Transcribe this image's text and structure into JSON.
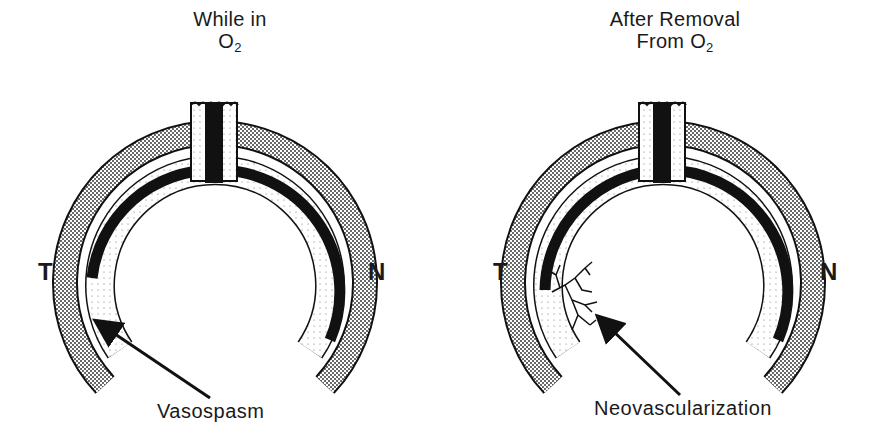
{
  "panels": [
    {
      "id": "left",
      "title_line1": "While in",
      "title_line2_base": "O",
      "title_line2_sub": "2",
      "label_temporal": "T",
      "label_nasal": "N",
      "callout": "Vasospasm"
    },
    {
      "id": "right",
      "title_line1": "After Removal",
      "title_line2_base": "From O",
      "title_line2_sub": "2",
      "label_temporal": "T",
      "label_nasal": "N",
      "callout": "Neovascularization"
    }
  ],
  "colors": {
    "ink": "#111111",
    "background": "#ffffff",
    "stipple": "#9a9a9a"
  }
}
